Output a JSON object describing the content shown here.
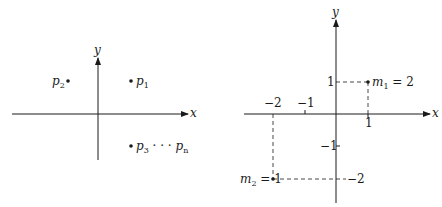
{
  "left_diagram": {
    "x_axis_label": "x",
    "y_axis_label": "y",
    "points": [
      {
        "name": "p",
        "sub": "1",
        "position": "quadrant I"
      },
      {
        "name": "p",
        "sub": "2",
        "position": "quadrant II"
      },
      {
        "name": "p",
        "sub": "3",
        "tail": " · · · ",
        "name2": "p",
        "sub2": "n",
        "position": "quadrant IV"
      }
    ]
  },
  "right_diagram": {
    "x_axis_label": "x",
    "y_axis_label": "y",
    "x_ticks": [
      "−2",
      "−1",
      "1"
    ],
    "y_ticks": [
      "1",
      "−1",
      "−2"
    ],
    "masses": [
      {
        "name": "m",
        "sub": "1",
        "value": " = 2",
        "x": 1,
        "y": 1
      },
      {
        "name": "m",
        "sub": "2",
        "value": " = 1",
        "x": -2,
        "y": -2
      }
    ]
  },
  "colors": {
    "ink": "#1a1a1a",
    "background": "#ffffff"
  }
}
